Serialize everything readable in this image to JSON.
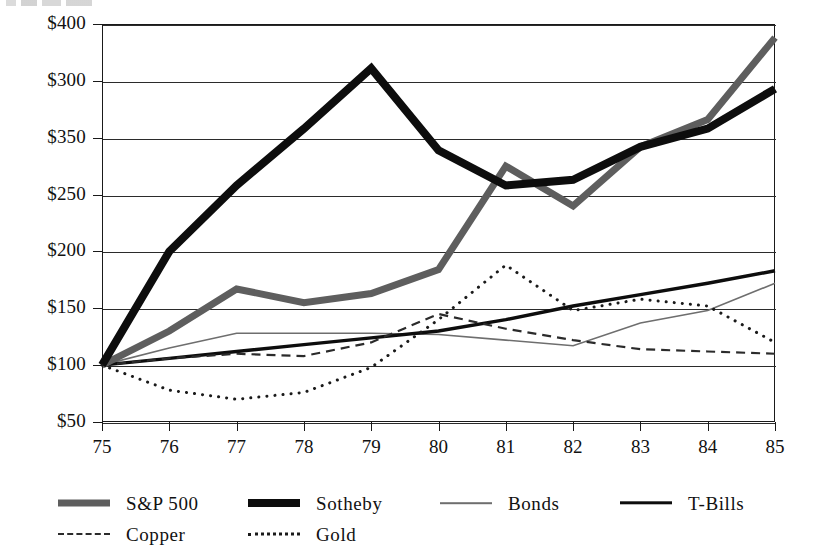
{
  "chart_data": {
    "type": "line",
    "title": "",
    "subtitle": "",
    "xlabel": "",
    "ylabel": "",
    "x": [
      "75",
      "76",
      "77",
      "78",
      "79",
      "80",
      "81",
      "82",
      "83",
      "84",
      "85"
    ],
    "x_tick_labels": [
      "75",
      "76",
      "77",
      "78",
      "79",
      "80",
      "81",
      "82",
      "83",
      "84",
      "85"
    ],
    "y_tick_labels": [
      "$400",
      "$300",
      "$350",
      "$250",
      "$200",
      "$150",
      "$100",
      "$50"
    ],
    "y_tick_positions": [
      400,
      375,
      350,
      300,
      250,
      200,
      150,
      100
    ],
    "ylim": [
      100,
      400
    ],
    "grid": true,
    "legend_position": "bottom-left",
    "series": [
      {
        "name": "S&P 500",
        "style": "solid-thick",
        "color": "#5e5e5e",
        "width": 7,
        "values": [
          100,
          130,
          167,
          155,
          163,
          184,
          275,
          240,
          292,
          316,
          388
        ]
      },
      {
        "name": "Sotheby",
        "style": "solid-thick",
        "color": "#0d0d0d",
        "width": 8,
        "values": [
          100,
          200,
          258,
          308,
          361,
          289,
          258,
          263,
          292,
          308,
          343
        ]
      },
      {
        "name": "Bonds",
        "style": "solid-thin",
        "color": "#6e6e6e",
        "width": 1.6,
        "values": [
          100,
          115,
          128,
          128,
          128,
          127,
          122,
          117,
          137,
          148,
          172
        ]
      },
      {
        "name": "T-Bills",
        "style": "solid-medium",
        "color": "#0d0d0d",
        "width": 3.4,
        "values": [
          100,
          106,
          112,
          118,
          124,
          130,
          140,
          152,
          162,
          172,
          183
        ]
      },
      {
        "name": "Copper",
        "style": "dashed",
        "color": "#2b2b2b",
        "width": 2.2,
        "values": [
          100,
          106,
          110,
          108,
          120,
          145,
          132,
          122,
          114,
          112,
          110
        ]
      },
      {
        "name": "Gold",
        "style": "dotted",
        "color": "#1a1a1a",
        "width": 3,
        "values": [
          100,
          78,
          70,
          76,
          98,
          140,
          188,
          148,
          158,
          152,
          120
        ]
      }
    ]
  },
  "legend": {
    "entries": [
      {
        "label": "S&P 500",
        "swatch": "sw-sp500",
        "icon": "thick-gray-line-icon",
        "row": 0,
        "x": 0
      },
      {
        "label": "Sotheby",
        "swatch": "sw-sotheby",
        "icon": "thick-black-line-icon",
        "row": 0,
        "x": 190
      },
      {
        "label": "Bonds",
        "swatch": "sw-bonds",
        "icon": "thin-gray-line-icon",
        "row": 0,
        "x": 382
      },
      {
        "label": "T-Bills",
        "swatch": "sw-tbills",
        "icon": "medium-black-line-icon",
        "row": 0,
        "x": 562
      },
      {
        "label": "Copper",
        "swatch": "sw-copper",
        "icon": "dashed-line-icon",
        "row": 1,
        "x": 0
      },
      {
        "label": "Gold",
        "swatch": "sw-gold",
        "icon": "dotted-line-icon",
        "row": 1,
        "x": 190
      }
    ]
  },
  "axis": {
    "y_labels": [
      "$400",
      "$300",
      "$350",
      "$250",
      "$200",
      "$150",
      "$100",
      "$50"
    ],
    "x_labels": [
      "75",
      "76",
      "77",
      "78",
      "79",
      "80",
      "81",
      "82",
      "83",
      "84",
      "85"
    ]
  },
  "colors": {
    "sp500": "#5e5e5e",
    "sotheby": "#0d0d0d",
    "bonds": "#6e6e6e",
    "tbills": "#0d0d0d",
    "copper": "#2b2b2b",
    "gold": "#1a1a1a",
    "axis": "#1a1a1a",
    "grid": "#2b2b2b",
    "background": "#ffffff"
  }
}
